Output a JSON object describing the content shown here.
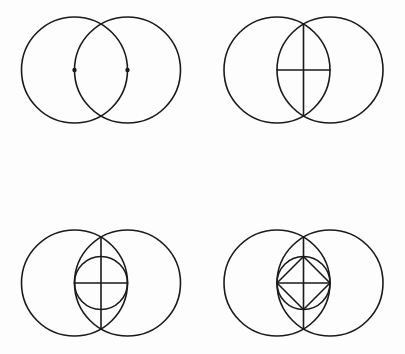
{
  "figure": {
    "background_color": "#fdfdfd",
    "stroke_color": "#1a1a1a",
    "stroke_width": 1.6,
    "canvas": {
      "width": 405,
      "height": 354
    },
    "panel_layout": {
      "rows": 2,
      "columns": 2,
      "count": 4
    }
  },
  "geometry": {
    "base_radius": 53,
    "center_separation": 53,
    "small_circle_radius": 26.5,
    "vesica_half_height": 45.9,
    "dot_radius": 2.2
  },
  "panels": [
    {
      "id": "panel-1",
      "name": "two-overlapping-circles",
      "label": "Step 1",
      "description": "Two equal circles whose centers each lie on the other's circumference, with both centers marked by dots.",
      "origin": {
        "x": 101,
        "y": 70
      },
      "centers": [
        {
          "name": "left-center",
          "x": 74.5,
          "y": 70
        },
        {
          "name": "right-center",
          "x": 127.5,
          "y": 70
        }
      ],
      "circles": [
        {
          "name": "left-circle",
          "cx": 74.5,
          "cy": 70,
          "r": 53
        },
        {
          "name": "right-circle",
          "cx": 127.5,
          "cy": 70,
          "r": 53
        }
      ],
      "dots": [
        {
          "name": "left-center-dot",
          "cx": 74.5,
          "cy": 70,
          "r": 2.2
        },
        {
          "name": "right-center-dot",
          "cx": 127.5,
          "cy": 70,
          "r": 2.2
        }
      ],
      "lines": [],
      "polygons": []
    },
    {
      "id": "panel-2",
      "name": "vesica-with-cross-axes",
      "label": "Step 2",
      "description": "The same two circles with a vertical chord joining the upper and lower intersection points, and a horizontal chord joining the two centers, forming a cross.",
      "origin": {
        "x": 303.5,
        "y": 70
      },
      "centers": [
        {
          "name": "left-center",
          "x": 277,
          "y": 70
        },
        {
          "name": "right-center",
          "x": 330,
          "y": 70
        }
      ],
      "circles": [
        {
          "name": "left-circle",
          "cx": 277,
          "cy": 70,
          "r": 53
        },
        {
          "name": "right-circle",
          "cx": 330,
          "cy": 70,
          "r": 53
        }
      ],
      "dots": [],
      "lines": [
        {
          "name": "vertical-axis",
          "x1": 303.5,
          "y1": 24.1,
          "x2": 303.5,
          "y2": 115.9
        },
        {
          "name": "horizontal-axis",
          "x1": 277,
          "y1": 70,
          "x2": 330,
          "y2": 70
        }
      ],
      "polygons": []
    },
    {
      "id": "panel-3",
      "name": "vesica-with-inscribed-circle",
      "label": "Step 3",
      "description": "The cross construction with an additional small circle centered on the cross intersection, passing through both circle centers.",
      "origin": {
        "x": 101,
        "y": 283
      },
      "centers": [
        {
          "name": "left-center",
          "x": 74.5,
          "y": 283
        },
        {
          "name": "right-center",
          "x": 127.5,
          "y": 283
        }
      ],
      "circles": [
        {
          "name": "left-circle",
          "cx": 74.5,
          "cy": 283,
          "r": 53
        },
        {
          "name": "right-circle",
          "cx": 127.5,
          "cy": 283,
          "r": 53
        },
        {
          "name": "small-inscribed-circle",
          "cx": 101,
          "cy": 283,
          "r": 26.5
        }
      ],
      "dots": [],
      "lines": [
        {
          "name": "vertical-axis",
          "x1": 101,
          "y1": 237.1,
          "x2": 101,
          "y2": 328.9
        },
        {
          "name": "horizontal-axis",
          "x1": 74.5,
          "y1": 283,
          "x2": 127.5,
          "y2": 283
        }
      ],
      "polygons": []
    },
    {
      "id": "panel-4",
      "name": "vesica-with-inscribed-square",
      "label": "Step 4",
      "description": "The previous construction with a square inscribed in the small circle, its vertices at the four cardinal points of that circle.",
      "origin": {
        "x": 303.5,
        "y": 283
      },
      "centers": [
        {
          "name": "left-center",
          "x": 277,
          "y": 283
        },
        {
          "name": "right-center",
          "x": 330,
          "y": 283
        }
      ],
      "circles": [
        {
          "name": "left-circle",
          "cx": 277,
          "cy": 283,
          "r": 53
        },
        {
          "name": "right-circle",
          "cx": 330,
          "cy": 283,
          "r": 53
        },
        {
          "name": "small-inscribed-circle",
          "cx": 303.5,
          "cy": 283,
          "r": 26.5
        }
      ],
      "dots": [],
      "lines": [
        {
          "name": "vertical-axis",
          "x1": 303.5,
          "y1": 237.1,
          "x2": 303.5,
          "y2": 328.9
        },
        {
          "name": "horizontal-axis",
          "x1": 277,
          "y1": 283,
          "x2": 330,
          "y2": 283
        }
      ],
      "polygons": [
        {
          "name": "inscribed-square",
          "points": "303.5,256.5 330,283 303.5,309.5 277,283"
        }
      ]
    }
  ]
}
